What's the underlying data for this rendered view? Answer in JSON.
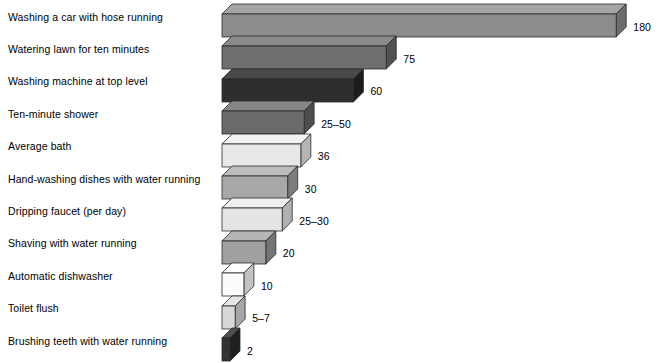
{
  "chart_data": {
    "type": "bar",
    "title": "",
    "subtitle": "",
    "xlabel": "",
    "ylabel": "",
    "orientation": "horizontal",
    "grid": false,
    "legend": "none",
    "axis_visible": false,
    "xlim": [
      0,
      180
    ],
    "categories": [
      "Washing a car with hose running",
      "Watering lawn for ten minutes",
      "Washing machine at top level",
      "Ten-minute shower",
      "Average bath",
      "Hand-washing dishes with water running",
      "Dripping faucet (per day)",
      "Shaving with water running",
      "Automatic dishwasher",
      "Toilet flush",
      "Brushing teeth with water running"
    ],
    "values": [
      180,
      75,
      60,
      37.5,
      36,
      30,
      27.5,
      20,
      10,
      6,
      2
    ],
    "value_labels": [
      "180",
      "75",
      "60",
      "25–50",
      "36",
      "30",
      "25–30",
      "20",
      "10",
      "5–7",
      "2"
    ],
    "bar_colors": [
      "#8c8c8c",
      "#6e6e6e",
      "#2e2e2e",
      "#6a6a6a",
      "#e8e8e8",
      "#a8a8a8",
      "#e4e4e4",
      "#a0a0a0",
      "#fbfbfb",
      "#d8d8d8",
      "#333333"
    ],
    "bars": [
      {
        "label": "Washing a car with hose running",
        "value": 180,
        "display": "180",
        "color": "#8c8c8c",
        "top": "#a5a5a5",
        "side": "#6d6d6d"
      },
      {
        "label": "Watering lawn for ten minutes",
        "value": 75,
        "display": "75",
        "color": "#6e6e6e",
        "top": "#8a8a8a",
        "side": "#525252"
      },
      {
        "label": "Washing machine at top level",
        "value": 60,
        "display": "60",
        "color": "#2e2e2e",
        "top": "#4a4a4a",
        "side": "#1c1c1c"
      },
      {
        "label": "Ten-minute shower",
        "value": 37.5,
        "display": "25–50",
        "color": "#6a6a6a",
        "top": "#868686",
        "side": "#4e4e4e"
      },
      {
        "label": "Average bath",
        "value": 36,
        "display": "36",
        "color": "#e8e8e8",
        "top": "#f2f2f2",
        "side": "#b4b4b4"
      },
      {
        "label": "Hand-washing dishes with water running",
        "value": 30,
        "display": "30",
        "color": "#a8a8a8",
        "top": "#bcbcbc",
        "side": "#7d7d7d"
      },
      {
        "label": "Dripping faucet (per day)",
        "value": 27.5,
        "display": "25–30",
        "color": "#e4e4e4",
        "top": "#efefef",
        "side": "#b0b0b0"
      },
      {
        "label": "Shaving with water running",
        "value": 20,
        "display": "20",
        "color": "#a0a0a0",
        "top": "#b6b6b6",
        "side": "#757575"
      },
      {
        "label": "Automatic dishwasher",
        "value": 10,
        "display": "10",
        "color": "#fbfbfb",
        "top": "#ffffff",
        "side": "#c2c2c2"
      },
      {
        "label": "Toilet flush",
        "value": 6,
        "display": "5–7",
        "color": "#d8d8d8",
        "top": "#e6e6e6",
        "side": "#a6a6a6"
      },
      {
        "label": "Brushing teeth with water running",
        "value": 2,
        "display": "2",
        "color": "#333333",
        "top": "#4d4d4d",
        "side": "#1f1f1f"
      }
    ],
    "units_note": ""
  }
}
